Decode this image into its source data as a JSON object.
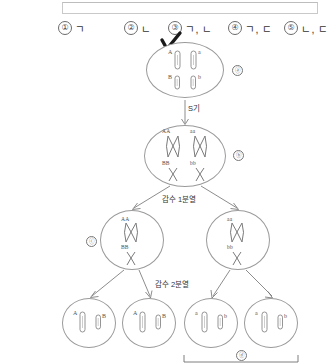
{
  "question": {
    "choices": [
      {
        "num": "①",
        "text": "ㄱ"
      },
      {
        "num": "②",
        "text": "ㄴ"
      },
      {
        "num": "③",
        "text": "ㄱ, ㄴ"
      },
      {
        "num": "④",
        "text": "ㄱ, ㄷ"
      },
      {
        "num": "⑤",
        "text": "ㄴ, ㄷ"
      }
    ],
    "selected_index": 2,
    "check_mark": "handwritten-check"
  },
  "diagram": {
    "steps": {
      "s_phase": "S기",
      "meiosis_1": "감수 1분열",
      "meiosis_2": "감수 2분열"
    },
    "markers": {
      "top_cell": "ⓐ",
      "replicated_cell": "ⓑ",
      "left_daughter": "ⓒ",
      "gamete_bracket": "ⓓ"
    },
    "cells": [
      {
        "id": "parent-cell",
        "stage": "before-replication",
        "chromosomes": [
          {
            "label": "A",
            "side": "left",
            "row": "top"
          },
          {
            "label": "a",
            "side": "right",
            "row": "top"
          },
          {
            "label": "B",
            "side": "left",
            "row": "bottom"
          },
          {
            "label": "b",
            "side": "right",
            "row": "bottom"
          }
        ]
      },
      {
        "id": "replicated-cell",
        "stage": "after-S-phase",
        "chromosomes": [
          {
            "label": "AA",
            "side": "left",
            "row": "top"
          },
          {
            "label": "aa",
            "side": "right",
            "row": "top"
          },
          {
            "label": "BB",
            "side": "left",
            "row": "bottom"
          },
          {
            "label": "bb",
            "side": "right",
            "row": "bottom"
          }
        ]
      },
      {
        "id": "daughter-cell-left",
        "stage": "after-meiosis-1",
        "chromosomes": [
          {
            "label": "AA",
            "row": "top"
          },
          {
            "label": "BB",
            "row": "bottom"
          }
        ]
      },
      {
        "id": "daughter-cell-right",
        "stage": "after-meiosis-1",
        "chromosomes": [
          {
            "label": "aa",
            "row": "top"
          },
          {
            "label": "bb",
            "row": "bottom"
          }
        ]
      },
      {
        "id": "gamete-1",
        "stage": "after-meiosis-2",
        "chromosomes": [
          {
            "label": "A",
            "side": "left"
          },
          {
            "label": "B",
            "side": "right"
          }
        ]
      },
      {
        "id": "gamete-2",
        "stage": "after-meiosis-2",
        "chromosomes": [
          {
            "label": "A",
            "side": "left"
          },
          {
            "label": "B",
            "side": "right"
          }
        ]
      },
      {
        "id": "gamete-3",
        "stage": "after-meiosis-2",
        "chromosomes": [
          {
            "label": "a",
            "side": "left"
          },
          {
            "label": "b",
            "side": "right"
          }
        ]
      },
      {
        "id": "gamete-4",
        "stage": "after-meiosis-2",
        "chromosomes": [
          {
            "label": "a",
            "side": "left"
          },
          {
            "label": "b",
            "side": "right"
          }
        ]
      }
    ]
  },
  "colors": {
    "ink": "#2b2b2b",
    "line": "#6f6f6f",
    "cell_border": "#9a9a9a",
    "label": "#555555"
  }
}
